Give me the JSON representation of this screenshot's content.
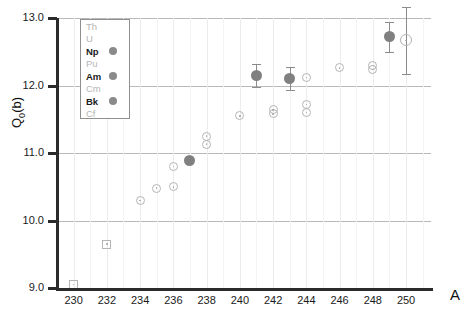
{
  "chart_data": {
    "type": "scatter",
    "title": "",
    "xlabel": "A",
    "ylabel": "Q_0(b)",
    "xlim": [
      229,
      251.5
    ],
    "ylim": [
      9.0,
      13.0
    ],
    "grid": true,
    "y_ticks": [
      "9.0",
      "10.0",
      "11.0",
      "12.0",
      "13.0"
    ],
    "y_tick_values": [
      9.0,
      10.0,
      11.0,
      12.0,
      13.0
    ],
    "x_ticks": [
      "230",
      "232",
      "234",
      "236",
      "238",
      "240",
      "242",
      "244",
      "246",
      "248",
      "250"
    ],
    "x_tick_values": [
      230,
      232,
      234,
      236,
      238,
      240,
      242,
      244,
      246,
      248,
      250
    ],
    "legend_position": "top-left",
    "series": [
      {
        "name": "Th",
        "label": "Th",
        "active": false,
        "marker": "open-square",
        "color": "#b5b5b5",
        "points": [
          {
            "x": 230,
            "y": 9.05,
            "err": 0
          },
          {
            "x": 232,
            "y": 9.65,
            "err": 0
          }
        ]
      },
      {
        "name": "U",
        "label": "U",
        "active": false,
        "marker": "open-circle",
        "color": "#b5b5b5",
        "points": [
          {
            "x": 234,
            "y": 10.3,
            "err": 0
          },
          {
            "x": 235,
            "y": 10.48,
            "err": 0
          },
          {
            "x": 236,
            "y": 10.5,
            "err": 0
          }
        ]
      },
      {
        "name": "Np",
        "label": "Np",
        "active": true,
        "marker": "filled-circle",
        "color": "#808080",
        "points": [
          {
            "x": 237,
            "y": 10.89,
            "err": 0
          }
        ]
      },
      {
        "name": "Pu",
        "label": "Pu",
        "active": false,
        "marker": "open-circle",
        "color": "#b5b5b5",
        "points": [
          {
            "x": 236,
            "y": 10.8,
            "err": 0
          },
          {
            "x": 238,
            "y": 11.25,
            "err": 0
          },
          {
            "x": 238,
            "y": 11.13,
            "err": 0
          },
          {
            "x": 240,
            "y": 11.55,
            "err": 0
          },
          {
            "x": 242,
            "y": 11.58,
            "err": 0
          },
          {
            "x": 244,
            "y": 11.6,
            "err": 0
          }
        ]
      },
      {
        "name": "Am",
        "label": "Am",
        "active": true,
        "marker": "filled-circle",
        "color": "#808080",
        "points": [
          {
            "x": 241,
            "y": 12.15,
            "err": 0.17
          },
          {
            "x": 243,
            "y": 12.1,
            "err": 0.17
          }
        ]
      },
      {
        "name": "Cm",
        "label": "Cm",
        "active": false,
        "marker": "open-circle",
        "color": "#b5b5b5",
        "points": [
          {
            "x": 242,
            "y": 11.64,
            "err": 0
          },
          {
            "x": 244,
            "y": 11.72,
            "err": 0
          },
          {
            "x": 244,
            "y": 12.12,
            "err": 0
          },
          {
            "x": 246,
            "y": 12.26,
            "err": 0
          },
          {
            "x": 248,
            "y": 12.3,
            "err": 0
          },
          {
            "x": 248,
            "y": 12.24,
            "err": 0
          }
        ]
      },
      {
        "name": "Bk",
        "label": "Bk",
        "active": true,
        "marker": "filled-circle",
        "color": "#808080",
        "points": [
          {
            "x": 249,
            "y": 12.72,
            "err": 0.22
          }
        ]
      },
      {
        "name": "Cf",
        "label": "Cf",
        "active": false,
        "marker": "open-circle-large",
        "color": "#b5b5b5",
        "points": [
          {
            "x": 250,
            "y": 12.67,
            "err": 0.5
          }
        ]
      }
    ]
  },
  "axes": {
    "y_title": "Q",
    "y_title_sub": "0",
    "y_title_unit": "(b)",
    "x_title": "A"
  },
  "legend": {
    "rows": [
      {
        "label": "Th",
        "active": false,
        "dot": false
      },
      {
        "label": "U",
        "active": false,
        "dot": false
      },
      {
        "label": "Np",
        "active": true,
        "dot": true
      },
      {
        "label": "Pu",
        "active": false,
        "dot": false
      },
      {
        "label": "Am",
        "active": true,
        "dot": true
      },
      {
        "label": "Cm",
        "active": false,
        "dot": false
      },
      {
        "label": "Bk",
        "active": true,
        "dot": true
      },
      {
        "label": "Cf",
        "active": false,
        "dot": false
      }
    ]
  }
}
